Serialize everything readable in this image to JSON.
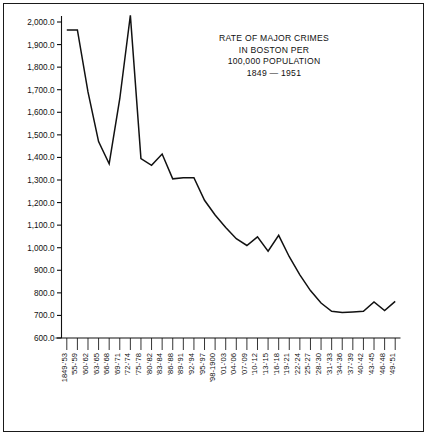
{
  "chart_data": {
    "type": "line",
    "title": "RATE OF MAJOR CRIMES IN BOSTON PER 100,000 POPULATION 1849 — 1951",
    "title_lines": [
      "RATE OF MAJOR CRIMES",
      "IN BOSTON PER",
      "100,000 POPULATION",
      "1849 — 1951"
    ],
    "xlabel": "",
    "ylabel": "",
    "ylim": [
      600,
      2000
    ],
    "ytick_step": 100,
    "grid": false,
    "legend": "none",
    "line_color": "#111111",
    "background_color": "#ffffff",
    "frame_color": "#1a1a1a",
    "ytick_labels": [
      "2,000.0",
      "1,900.0",
      "1,800.0",
      "1,700.0",
      "1,600.0",
      "1,500.0",
      "1,400.0",
      "1,300.0",
      "1,200.0",
      "1,100.0",
      "1,000.0",
      "900.0",
      "800.0",
      "700.0",
      "600.0"
    ],
    "ytick_values": [
      2000,
      1900,
      1800,
      1700,
      1600,
      1500,
      1400,
      1300,
      1200,
      1100,
      1000,
      900,
      800,
      700,
      600
    ],
    "categories": [
      "1849-'53",
      "'55-'59",
      "'60-'62",
      "'63-'65",
      "'66-'68",
      "'69-'71",
      "'72-'74",
      "'75-'78",
      "'80-'82",
      "'83-'84",
      "'86-'88",
      "'89-'91",
      "'92-'94",
      "'95-'97",
      "'98-1900",
      "'01-'03",
      "'04-'06",
      "'07-'09",
      "'10-'12",
      "'13-'15",
      "'16-'18",
      "'19-'21",
      "'22-'24",
      "'25-'27",
      "'28-'30",
      "'31-'33",
      "'34-'36",
      "'37-'39",
      "'40-'42",
      "'43-'45",
      "'46-'48",
      "'49-'51"
    ],
    "values": [
      1965,
      1965,
      1690,
      1470,
      1372,
      1660,
      2030,
      1395,
      1365,
      1415,
      1305,
      1310,
      1310,
      1210,
      1145,
      1090,
      1040,
      1010,
      1048,
      985,
      1055,
      960,
      880,
      810,
      755,
      718,
      713,
      715,
      718,
      760,
      722,
      762
    ]
  }
}
